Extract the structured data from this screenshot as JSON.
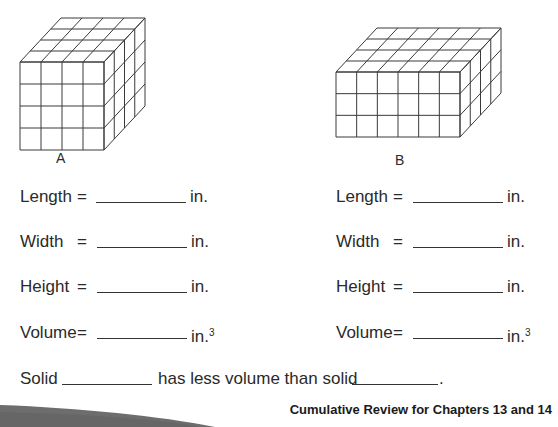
{
  "solids": [
    {
      "id": "A",
      "caption": "A",
      "length_cubes": 4,
      "width_cubes": 4,
      "height_cubes": 4
    },
    {
      "id": "B",
      "caption": "B",
      "length_cubes": 6,
      "width_cubes": 4,
      "height_cubes": 3
    }
  ],
  "fields": {
    "length": "Length",
    "width": "Width",
    "height": "Height",
    "volume": "Volume",
    "equals": "=",
    "unit": "in.",
    "unit_cubed_exp": "3",
    "answer_a_length": "",
    "answer_a_width": "",
    "answer_a_height": "",
    "answer_a_volume": "",
    "answer_b_length": "",
    "answer_b_width": "",
    "answer_b_height": "",
    "answer_b_volume": ""
  },
  "comparison": {
    "prefix": "Solid",
    "middle": "has less volume than solid",
    "suffix": ".",
    "blank1": "",
    "blank2": ""
  },
  "footer": {
    "text": "Cumulative Review for Chapters 13 and 14"
  },
  "colors": {
    "line": "#3a3a3a",
    "swoosh": "#6d6d6d"
  }
}
